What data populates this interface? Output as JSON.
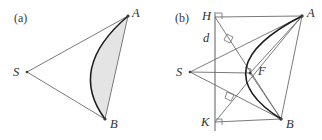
{
  "figure": {
    "width": 322,
    "height": 140,
    "background": "#ffffff",
    "stroke_color": "#6b6b6b",
    "curve_color": "#1d1d1d",
    "fill_color": "#e4e4e4",
    "point_color": "#3b3b3b"
  },
  "panels": [
    {
      "id": "a",
      "label": "(a)",
      "description": "Region bounded by a convex arc from A to B and the two straight segments SA and SB, with the area between the chord-side arc and the segments AB shaded.",
      "points": [
        {
          "name": "S",
          "label": "S",
          "x": 27,
          "y": 72,
          "label_x": 13,
          "label_y": 65
        },
        {
          "name": "A",
          "label": "A",
          "x": 128,
          "y": 16,
          "label_x": 132,
          "label_y": 6
        },
        {
          "name": "B",
          "label": "B",
          "x": 105,
          "y": 119,
          "label_x": 110,
          "label_y": 117
        }
      ],
      "segments": [
        {
          "name": "segment-SA",
          "from": "S",
          "to": "A"
        },
        {
          "name": "segment-SB",
          "from": "S",
          "to": "B"
        },
        {
          "name": "segment-AB",
          "from": "A",
          "to": "B"
        }
      ],
      "arc": {
        "name": "arc-AB",
        "from": "A",
        "to": "B",
        "bulge_toward": "S",
        "control_x": 67,
        "control_y": 68
      },
      "shaded_region": {
        "name": "shaded-lune",
        "bounded_by": [
          "arc-AB",
          "segment-AB"
        ]
      }
    },
    {
      "id": "b",
      "label": "(b)",
      "description": "Same configuration with the directrix line d drawn vertically, feet of perpendiculars H and K from A and B, focus F, and perpendicular tangent constructions marked with right angles.",
      "points": [
        {
          "name": "S",
          "label": "S",
          "x": 29,
          "y": 72,
          "label_x": 15,
          "label_y": 65
        },
        {
          "name": "A",
          "label": "A",
          "x": 141,
          "y": 16,
          "label_x": 146,
          "label_y": 6
        },
        {
          "name": "B",
          "label": "B",
          "x": 120,
          "y": 119,
          "label_x": 125,
          "label_y": 117
        },
        {
          "name": "H",
          "label": "H",
          "x": 54,
          "y": 17,
          "label_x": 41,
          "label_y": 9
        },
        {
          "name": "K",
          "label": "K",
          "x": 54,
          "y": 122,
          "label_x": 40,
          "label_y": 115
        },
        {
          "name": "F",
          "label": "F",
          "x": 89,
          "y": 73,
          "label_x": 97,
          "label_y": 64
        }
      ],
      "directrix": {
        "name": "directrix-d",
        "label": "d",
        "x": 54,
        "y_top": 12,
        "y_bottom": 131,
        "label_x": 42,
        "label_y": 31
      },
      "segments": [
        {
          "name": "segment-SA",
          "from": "S",
          "to": "A"
        },
        {
          "name": "segment-SB",
          "from": "S",
          "to": "B"
        },
        {
          "name": "segment-AB",
          "from": "A",
          "to": "B"
        },
        {
          "name": "segment-HA",
          "from": "H",
          "to": "A"
        },
        {
          "name": "segment-KB",
          "from": "K",
          "to": "B"
        },
        {
          "name": "segment-HB",
          "from": "H",
          "to": "B"
        },
        {
          "name": "segment-KA",
          "from": "K",
          "to": "A"
        },
        {
          "name": "segment-SF",
          "from": "S",
          "to": "F"
        },
        {
          "name": "segment-FA",
          "from": "F",
          "to": "A"
        },
        {
          "name": "segment-FB",
          "from": "F",
          "to": "B"
        }
      ],
      "arc": {
        "name": "arc-AB",
        "from": "A",
        "to": "B",
        "control_x": 40,
        "control_y": 68
      },
      "right_angle_marks": [
        {
          "name": "right-angle-at-H",
          "x": 56,
          "y": 13
        },
        {
          "name": "right-angle-at-K",
          "x": 56,
          "y": 114
        },
        {
          "name": "right-angle-upper-tangent",
          "x": 69,
          "y": 37
        },
        {
          "name": "right-angle-lower-tangent",
          "x": 70,
          "y": 95
        },
        {
          "name": "right-angle-at-F",
          "x": 86,
          "y": 70
        }
      ]
    }
  ]
}
